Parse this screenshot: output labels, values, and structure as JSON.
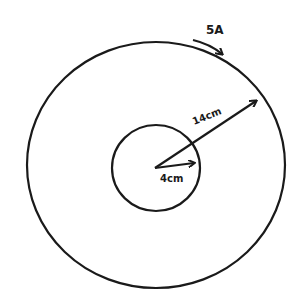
{
  "diagram": {
    "type": "concentric-circles",
    "stroke_color": "#1a1a1a",
    "background": "#ffffff",
    "outer_circle": {
      "radius_label": "14cm",
      "cx": 156,
      "cy": 165,
      "rx": 129,
      "ry": 123
    },
    "inner_circle": {
      "radius_label": "4cm",
      "cx": 156,
      "cy": 168,
      "rx": 44,
      "ry": 43
    },
    "current": {
      "label": "5A",
      "direction": "clockwise"
    },
    "labels": {
      "current": "5A",
      "outer_radius": "14cm",
      "inner_radius": "4cm"
    }
  }
}
